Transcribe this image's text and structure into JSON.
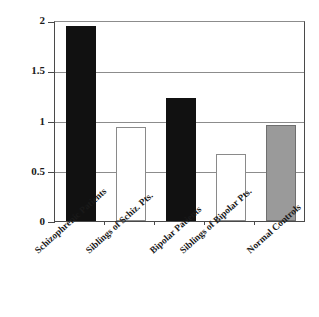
{
  "chart_data": {
    "type": "bar",
    "title": "",
    "xlabel": "",
    "ylabel": "",
    "ylim": [
      0,
      2
    ],
    "yticks": [
      0,
      0.5,
      1,
      1.5,
      2
    ],
    "ytick_labels": [
      "0",
      "0.5",
      "1",
      "1.5",
      "2"
    ],
    "grid": true,
    "legend": "none",
    "categories": [
      "Schizophrenic Patients",
      "Siblings of  Schiz. Pts.",
      "Bipolar Patients",
      "Siblings of Bipolar Pts.",
      "Normal Controls"
    ],
    "values": [
      1.96,
      0.95,
      1.24,
      0.67,
      0.97
    ],
    "bar_colors": [
      "#111111",
      "#ffffff",
      "#111111",
      "#ffffff",
      "#9a9a9a"
    ],
    "bar_styles": [
      "black",
      "white",
      "black",
      "white",
      "grey"
    ],
    "points": [
      {
        "category": "Schizophrenic Patients",
        "value": 1.96,
        "style": "black"
      },
      {
        "category": "Siblings of  Schiz. Pts.",
        "value": 0.95,
        "style": "white"
      },
      {
        "category": "Bipolar Patients",
        "value": 1.24,
        "style": "black"
      },
      {
        "category": "Siblings of Bipolar Pts.",
        "value": 0.67,
        "style": "white"
      },
      {
        "category": "Normal Controls",
        "value": 0.97,
        "style": "grey"
      }
    ],
    "colors": {
      "axis": "#4a4a4a",
      "gridline": "#8c8c8c",
      "black_bar": "#111111",
      "white_bar_fill": "#ffffff",
      "white_bar_edge": "#8a8a8a",
      "grey_bar": "#9a9a9a",
      "background": "#ffffff",
      "text": "#1a1a1a"
    }
  }
}
